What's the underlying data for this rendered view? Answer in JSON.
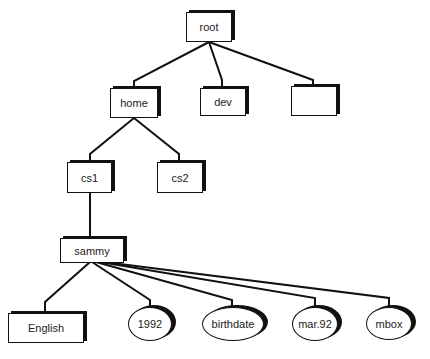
{
  "diagram": {
    "type": "directory-tree",
    "nodes": [
      {
        "id": "root",
        "label": "root",
        "shape": "box"
      },
      {
        "id": "home",
        "label": "home",
        "shape": "box"
      },
      {
        "id": "dev",
        "label": "dev",
        "shape": "box"
      },
      {
        "id": "blank",
        "label": "",
        "shape": "box"
      },
      {
        "id": "cs1",
        "label": "cs1",
        "shape": "box"
      },
      {
        "id": "cs2",
        "label": "cs2",
        "shape": "box"
      },
      {
        "id": "sammy",
        "label": "sammy",
        "shape": "box"
      },
      {
        "id": "English",
        "label": "English",
        "shape": "box"
      },
      {
        "id": "1992",
        "label": "1992",
        "shape": "oval"
      },
      {
        "id": "birthdate",
        "label": "birthdate",
        "shape": "oval"
      },
      {
        "id": "mar92",
        "label": "mar.92",
        "shape": "oval"
      },
      {
        "id": "mbox",
        "label": "mbox",
        "shape": "oval"
      }
    ],
    "edges": [
      [
        "root",
        "home"
      ],
      [
        "root",
        "dev"
      ],
      [
        "root",
        "blank"
      ],
      [
        "home",
        "cs1"
      ],
      [
        "home",
        "cs2"
      ],
      [
        "cs1",
        "sammy"
      ],
      [
        "sammy",
        "English"
      ],
      [
        "sammy",
        "1992"
      ],
      [
        "sammy",
        "birthdate"
      ],
      [
        "sammy",
        "mar92"
      ],
      [
        "sammy",
        "mbox"
      ]
    ]
  }
}
